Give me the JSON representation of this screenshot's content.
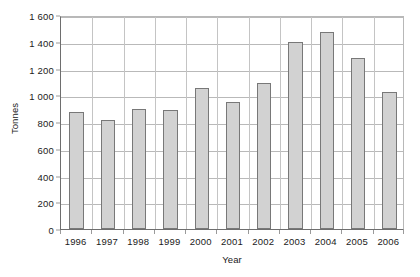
{
  "chart_data": {
    "type": "bar",
    "title": "",
    "xlabel": "Year",
    "ylabel": "Tonnes",
    "categories": [
      "1996",
      "1997",
      "1998",
      "1999",
      "2000",
      "2001",
      "2002",
      "2003",
      "2004",
      "2005",
      "2006"
    ],
    "values": [
      875,
      815,
      895,
      890,
      1055,
      950,
      1090,
      1400,
      1470,
      1275,
      1025
    ],
    "ylim": [
      0,
      1600
    ],
    "ytick_values": [
      0,
      200,
      400,
      600,
      800,
      1000,
      1200,
      1400,
      1600
    ],
    "ytick_labels": [
      "0",
      "200",
      "400",
      "600",
      "800",
      "1 000",
      "1 200",
      "1 400",
      "1 600"
    ],
    "grid": "horizontal-and-vertical",
    "legend": "none",
    "bar_fill_color": "#d2d2d2",
    "bar_border_color": "#787878",
    "gridline_color": "#b9b9b9",
    "axis_color": "#6e6e6e",
    "text_color": "#1a1a1a",
    "background_color": "#ffffff"
  }
}
